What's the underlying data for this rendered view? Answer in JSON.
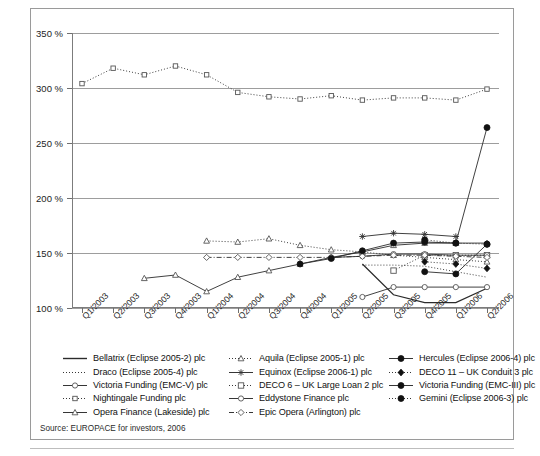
{
  "figure": {
    "source_note": "Source: EUROPACE for investors, 2006"
  },
  "chart_data": {
    "type": "line",
    "title": "",
    "xlabel": "",
    "ylabel": "",
    "ylim": [
      100,
      350
    ],
    "yticks": [
      100,
      150,
      200,
      250,
      300,
      350
    ],
    "ytick_labels": [
      "100 %",
      "150 %",
      "200 %",
      "250 %",
      "300 %",
      "350 %"
    ],
    "grid": true,
    "legend_position": "below",
    "categories": [
      "Q1/2003",
      "Q2/2003",
      "Q3/2003",
      "Q4/2003",
      "Q1/2004",
      "Q2/2004",
      "Q3/2004",
      "Q4/2004",
      "Q1/2005",
      "Q2/2005",
      "Q3/2005",
      "Q4/2005",
      "Q1/2006",
      "Q2/2006"
    ],
    "series": [
      {
        "name": "Bellatrix (Eclipse 2005-2) plc",
        "key": "bellatrix",
        "marker": "none",
        "dash": "solid",
        "fill": "none",
        "x": [
          "Q2/2005",
          "Q3/2005",
          "Q4/2005",
          "Q1/2006",
          "Q2/2006"
        ],
        "values": [
          140,
          112,
          105,
          105,
          118
        ]
      },
      {
        "name": "Draco (Eclipse 2005-4) plc",
        "key": "draco",
        "marker": "none",
        "dash": "dotted",
        "fill": "none",
        "x": [
          "Q2/2005",
          "Q3/2005",
          "Q4/2005",
          "Q1/2006",
          "Q2/2006"
        ],
        "values": [
          139,
          139,
          138,
          133,
          128
        ]
      },
      {
        "name": "Victoria Funding (EMC-V) plc",
        "key": "victoria-emc-v",
        "marker": "open-circle",
        "dash": "solid",
        "fill": "none",
        "x": [
          "Q2/2005",
          "Q3/2005",
          "Q4/2005",
          "Q1/2006",
          "Q2/2006"
        ],
        "values": [
          110,
          119,
          119,
          119,
          119
        ]
      },
      {
        "name": "Nightingale Funding plc",
        "key": "nightingale",
        "marker": "open-square-small",
        "dash": "dotted",
        "fill": "none",
        "x": [
          "Q1/2003",
          "Q2/2003",
          "Q3/2003",
          "Q4/2003",
          "Q1/2004",
          "Q2/2004",
          "Q3/2004",
          "Q4/2004",
          "Q1/2005",
          "Q2/2005",
          "Q3/2005",
          "Q4/2005",
          "Q1/2006",
          "Q2/2006"
        ],
        "values": [
          304,
          318,
          312,
          320,
          312,
          296,
          292,
          290,
          293,
          289,
          291,
          291,
          289,
          299
        ]
      },
      {
        "name": "Opera Finance (Lakeside) plc",
        "key": "opera-lakeside",
        "marker": "open-triangle",
        "dash": "solid",
        "fill": "none",
        "x": [
          "Q3/2003",
          "Q4/2003",
          "Q1/2004",
          "Q2/2004",
          "Q3/2004",
          "Q4/2004",
          "Q1/2005",
          "Q2/2005",
          "Q3/2005",
          "Q4/2005",
          "Q1/2006",
          "Q2/2006"
        ],
        "values": [
          127,
          130,
          115,
          128,
          134,
          140,
          146,
          151,
          157,
          159,
          159,
          159
        ]
      },
      {
        "name": "Aquila (Eclipse 2005-1) plc",
        "key": "aquila",
        "marker": "open-triangle",
        "dash": "dotted",
        "fill": "none",
        "x": [
          "Q1/2004",
          "Q2/2004",
          "Q3/2004",
          "Q4/2004",
          "Q1/2005",
          "Q2/2005",
          "Q3/2005",
          "Q4/2005",
          "Q1/2006",
          "Q2/2006"
        ],
        "values": [
          161,
          160,
          163,
          157,
          153,
          151,
          148,
          146,
          144,
          142
        ]
      },
      {
        "name": "Equinox (Eclipse 2006-1) plc",
        "key": "equinox",
        "marker": "star",
        "dash": "solid",
        "fill": "none",
        "x": [
          "Q2/2005",
          "Q3/2005",
          "Q4/2005",
          "Q1/2006"
        ],
        "values": [
          165,
          168,
          167,
          165
        ]
      },
      {
        "name": "DECO 6 – UK Large Loan 2 plc",
        "key": "deco-6",
        "marker": "open-square",
        "dash": "dotted",
        "fill": "none",
        "x": [
          "Q3/2005",
          "Q4/2005",
          "Q1/2006",
          "Q2/2006"
        ],
        "values": [
          134,
          148,
          148,
          148
        ]
      },
      {
        "name": "Eddystone Finance plc",
        "key": "eddystone",
        "marker": "open-circle",
        "dash": "solid",
        "fill": "none",
        "x": [
          "Q1/2005",
          "Q2/2005",
          "Q3/2005",
          "Q4/2005",
          "Q1/2006",
          "Q2/2006"
        ],
        "values": [
          146,
          147,
          149,
          149,
          148,
          148
        ]
      },
      {
        "name": "Epic Opera (Arlington) plc",
        "key": "epic-opera",
        "marker": "open-diamond",
        "dash": "dash-dot",
        "fill": "none",
        "x": [
          "Q1/2004",
          "Q2/2004",
          "Q3/2004",
          "Q4/2004",
          "Q1/2005",
          "Q2/2005",
          "Q3/2005",
          "Q4/2005",
          "Q1/2006",
          "Q2/2006"
        ],
        "values": [
          146,
          146,
          146,
          146,
          146,
          147,
          148,
          148,
          147,
          146
        ]
      },
      {
        "name": "Hercules (Eclipse 2006-4) plc",
        "key": "hercules",
        "marker": "filled-circle",
        "dash": "solid",
        "fill": "solid",
        "x": [
          "Q4/2004",
          "Q1/2005",
          "Q2/2005",
          "Q3/2005",
          "Q4/2005",
          "Q1/2006",
          "Q2/2006"
        ],
        "values": [
          140,
          145,
          152,
          159,
          160,
          159,
          264
        ]
      },
      {
        "name": "DECO 11 – UK Conduit 3 plc",
        "key": "deco-11",
        "marker": "filled-diamond",
        "dash": "dotted",
        "fill": "solid",
        "x": [
          "Q4/2005",
          "Q1/2006",
          "Q2/2006"
        ],
        "values": [
          142,
          140,
          136
        ]
      },
      {
        "name": "Victoria Funding (EMC-III) plc",
        "key": "victoria-emc-iii",
        "marker": "filled-circle",
        "dash": "solid",
        "fill": "solid",
        "x": [
          "Q4/2005",
          "Q1/2006",
          "Q2/2006"
        ],
        "values": [
          133,
          131,
          158
        ]
      },
      {
        "name": "Gemini (Eclipse 2006-3) plc",
        "key": "gemini",
        "marker": "filled-circle",
        "dash": "dotted",
        "fill": "solid",
        "x": [
          "Q4/2005",
          "Q1/2006",
          "Q2/2006"
        ],
        "values": [
          162,
          159,
          158
        ]
      }
    ]
  },
  "legend": {
    "columns": [
      [
        {
          "label": "Bellatrix (Eclipse 2005-2) plc",
          "key": "bellatrix"
        },
        {
          "label": "Draco (Eclipse 2005-4) plc",
          "key": "draco"
        },
        {
          "label": "Victoria Funding (EMC-V) plc",
          "key": "victoria-emc-v"
        },
        {
          "label": "Nightingale Funding plc",
          "key": "nightingale"
        },
        {
          "label": "Opera Finance (Lakeside) plc",
          "key": "opera-lakeside"
        }
      ],
      [
        {
          "label": "Aquila (Eclipse 2005-1) plc",
          "key": "aquila"
        },
        {
          "label": "Equinox (Eclipse 2006-1) plc",
          "key": "equinox"
        },
        {
          "label": "DECO 6 – UK Large Loan 2 plc",
          "key": "deco-6"
        },
        {
          "label": "Eddystone Finance plc",
          "key": "eddystone"
        },
        {
          "label": "Epic Opera (Arlington) plc",
          "key": "epic-opera"
        }
      ],
      [
        {
          "label": "Hercules (Eclipse 2006-4) plc",
          "key": "hercules"
        },
        {
          "label": "DECO 11 – UK Conduit 3 plc",
          "key": "deco-11"
        },
        {
          "label": "Victoria Funding (EMC-III) plc",
          "key": "victoria-emc-iii"
        },
        {
          "label": "Gemini (Eclipse 2006-3) plc",
          "key": "gemini"
        }
      ]
    ]
  },
  "colors": {
    "line": "#2b2b2b",
    "grid": "#9d9d9d",
    "axis": "#7c7c7c",
    "frame": "#9a9a9a",
    "text": "#1a1a1a"
  }
}
